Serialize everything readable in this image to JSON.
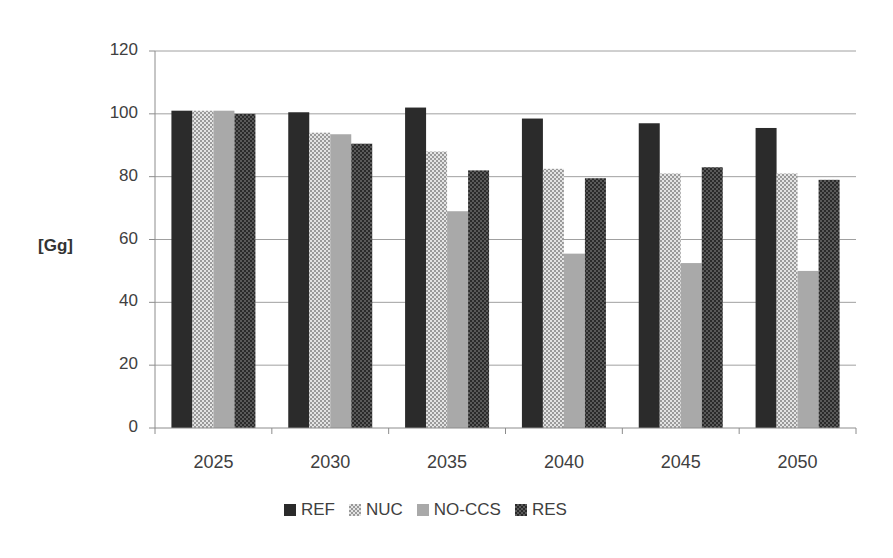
{
  "chart_data": {
    "type": "bar",
    "title": "",
    "xlabel": "",
    "ylabel": "[Gg]",
    "ylim": [
      0,
      120
    ],
    "yticks": [
      0,
      20,
      40,
      60,
      80,
      100,
      120
    ],
    "grid": true,
    "legend_position": "bottom",
    "categories": [
      "2025",
      "2030",
      "2035",
      "2040",
      "2045",
      "2050"
    ],
    "series": [
      {
        "name": "REF",
        "values": [
          101,
          100.5,
          102,
          98.5,
          97,
          95.5
        ]
      },
      {
        "name": "NUC",
        "values": [
          101,
          94,
          88,
          82.5,
          81,
          81
        ]
      },
      {
        "name": "NO-CCS",
        "values": [
          101,
          93.5,
          69,
          55.5,
          52.5,
          50
        ]
      },
      {
        "name": "RES",
        "values": [
          100,
          90.5,
          82,
          79.5,
          83,
          79
        ]
      }
    ]
  },
  "styles": {
    "REF": {
      "fill": "#2b2b2b",
      "pattern": "solid"
    },
    "NUC": {
      "fill": "#c4c4c4",
      "pattern": "light-check"
    },
    "NO-CCS": {
      "fill": "#a9a9a9",
      "pattern": "solid"
    },
    "RES": {
      "fill": "#353535",
      "pattern": "dark-check"
    },
    "gridline": "#a0a0a0",
    "axis": "#8c8c8c"
  },
  "labels": {
    "y_axis_title": "[Gg]"
  }
}
